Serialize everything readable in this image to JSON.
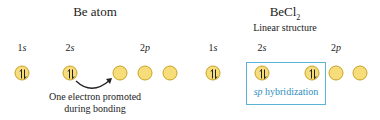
{
  "left": {
    "title": "Be atom",
    "labels": [
      {
        "n": "1",
        "l": "s"
      },
      {
        "n": "2",
        "l": "s"
      },
      {
        "n": "2",
        "l": "p"
      }
    ],
    "orbitals": [
      "paired",
      "paired",
      "empty",
      "empty",
      "empty"
    ],
    "caption_line1": "One electron promoted",
    "caption_line2": "during bonding"
  },
  "right": {
    "title_main": "BeCl",
    "title_sub": "2",
    "subtitle": "Linear structure",
    "labels": [
      {
        "n": "1",
        "l": "s"
      },
      {
        "n": "2",
        "l": "s"
      },
      {
        "n": "2",
        "l": "p"
      }
    ],
    "orbitals": [
      "paired",
      "paired",
      "paired",
      "empty",
      "empty"
    ],
    "hybrid_label_italic": "sp",
    "hybrid_label_rest": " hybridization"
  },
  "colors": {
    "orbital_fill": "#f7dd7a",
    "orbital_stroke": "#c9a227",
    "hybrid_box": "#5ab3d6",
    "hybrid_text": "#2f8fc0"
  }
}
